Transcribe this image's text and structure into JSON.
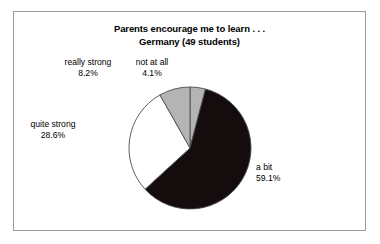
{
  "figure": {
    "border_color": "#9a9a9a",
    "background": "#ffffff"
  },
  "title": {
    "line1": "Parents encourage me to learn . . .",
    "line2": "Germany (49 students)"
  },
  "labels": {
    "really_strong": {
      "name": "really strong",
      "pct": "8.2%"
    },
    "not_at_all": {
      "name": "not at all",
      "pct": "4.1%"
    },
    "quite_strong": {
      "name": "quite strong",
      "pct": "28.6%"
    },
    "a_bit": {
      "name": "a bit",
      "pct": "59.1%"
    }
  },
  "chart_data": {
    "type": "pie",
    "title": "Parents encourage me to learn . . . Germany (49 students)",
    "subtitle": "Germany (49 students)",
    "total_respondents": 49,
    "start_angle_deg": 0,
    "direction": "clockwise",
    "categories": [
      "not at all",
      "a bit",
      "quite strong",
      "really strong"
    ],
    "values": [
      4.1,
      59.1,
      28.6,
      8.2
    ],
    "value_unit": "percent",
    "labels_shown": [
      "not at all 4.1%",
      "a bit 59.1%",
      "quite strong 28.6%",
      "really strong 8.2%"
    ],
    "colors": [
      "#b4b4b4",
      "#150d0d",
      "#ffffff",
      "#b4b4b4"
    ],
    "slice_edge_color": "#4d4d4d",
    "legend": "none",
    "grid": false,
    "slices": [
      {
        "label": "not at all",
        "value": 4.1,
        "color": "#b4b4b4",
        "start_deg": 0.0,
        "end_deg": 14.76
      },
      {
        "label": "a bit",
        "value": 59.1,
        "color": "#150d0d",
        "start_deg": 14.76,
        "end_deg": 227.52
      },
      {
        "label": "quite strong",
        "value": 28.6,
        "color": "#ffffff",
        "start_deg": 227.52,
        "end_deg": 330.48
      },
      {
        "label": "really strong",
        "value": 8.2,
        "color": "#b4b4b4",
        "start_deg": 330.48,
        "end_deg": 360.0
      }
    ]
  }
}
